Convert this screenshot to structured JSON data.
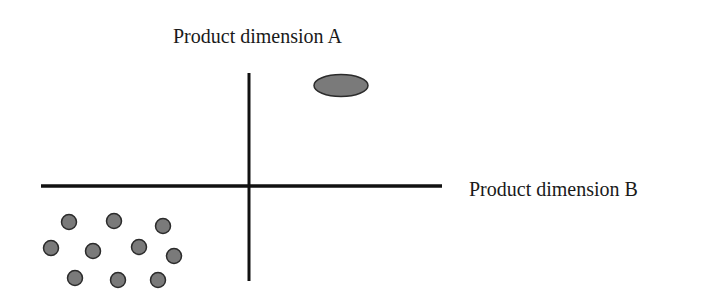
{
  "diagram": {
    "type": "perceptual-map",
    "axes": {
      "vertical": {
        "label": "Product dimension A",
        "x": 249,
        "y1": 73,
        "y2": 281
      },
      "horizontal": {
        "label": "Product dimension B",
        "y": 186,
        "x1": 41,
        "x2": 442
      }
    },
    "colors": {
      "axis": "#111111",
      "marker_fill": "#7a7a7a",
      "marker_stroke": "#2b2b2b",
      "text": "#1a1a1a"
    },
    "large_marker": {
      "shape": "ellipse",
      "cx": 341,
      "cy": 85.5,
      "rx": 27,
      "ry": 11
    },
    "cluster_markers": [
      {
        "cx": 69,
        "cy": 222
      },
      {
        "cx": 114,
        "cy": 221
      },
      {
        "cx": 163,
        "cy": 226
      },
      {
        "cx": 51,
        "cy": 248
      },
      {
        "cx": 93,
        "cy": 251
      },
      {
        "cx": 139,
        "cy": 247
      },
      {
        "cx": 174,
        "cy": 256
      },
      {
        "cx": 75,
        "cy": 278
      },
      {
        "cx": 118,
        "cy": 280
      },
      {
        "cx": 158,
        "cy": 280
      }
    ],
    "cluster_marker_radius": 7.5
  }
}
